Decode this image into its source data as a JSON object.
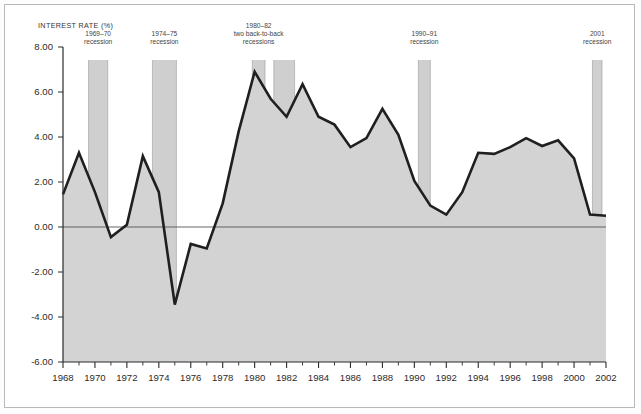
{
  "chart_data": {
    "type": "area",
    "title": "INTEREST RATE (%)",
    "xlabel": "",
    "ylabel": "INTEREST RATE (%)",
    "ylim": [
      -6.0,
      8.0
    ],
    "xlim": [
      1968,
      2002
    ],
    "grid": false,
    "legend": "none",
    "y_ticks": [
      "8.00",
      "6.00",
      "4.00",
      "2.00",
      "0.00",
      "-2.00",
      "-4.00",
      "-6.00"
    ],
    "y_tick_values": [
      8,
      6,
      4,
      2,
      0,
      -2,
      -4,
      -6
    ],
    "x_ticks": [
      "1968",
      "1970",
      "1972",
      "1974",
      "1976",
      "1978",
      "1980",
      "1982",
      "1984",
      "1986",
      "1988",
      "1990",
      "1992",
      "1994",
      "1996",
      "1998",
      "2000",
      "2002"
    ],
    "x_tick_values": [
      1968,
      1970,
      1972,
      1974,
      1976,
      1978,
      1980,
      1982,
      1984,
      1986,
      1988,
      1990,
      1992,
      1994,
      1996,
      1998,
      2000,
      2002
    ],
    "x_minor_step": 1,
    "series": [
      {
        "name": "Interest rate",
        "x": [
          1968,
          1969,
          1970,
          1971,
          1972,
          1973,
          1974,
          1975,
          1976,
          1977,
          1978,
          1979,
          1980,
          1981,
          1982,
          1983,
          1984,
          1985,
          1986,
          1987,
          1988,
          1989,
          1990,
          1991,
          1992,
          1993,
          1994,
          1995,
          1996,
          1997,
          1998,
          1999,
          2000,
          2001,
          2002
        ],
        "values": [
          1.45,
          3.3,
          1.55,
          -0.45,
          0.1,
          3.15,
          1.55,
          -3.45,
          -0.75,
          -0.95,
          1.05,
          4.25,
          6.9,
          5.7,
          4.9,
          6.35,
          4.9,
          4.55,
          3.55,
          3.95,
          5.25,
          4.1,
          2.05,
          0.95,
          0.55,
          1.55,
          3.3,
          3.25,
          3.55,
          3.95,
          3.6,
          3.85,
          3.05,
          0.55,
          0.5
        ]
      }
    ],
    "annotations": [
      {
        "id": "recession-1969-70",
        "label_line1": "1969–70",
        "label_line2": "recession",
        "x_start": 1969.6,
        "x_end": 1970.8
      },
      {
        "id": "recession-1974-75",
        "label_line1": "1974–75",
        "label_line2": "recession",
        "x_start": 1973.6,
        "x_end": 1975.1
      },
      {
        "id": "recession-1980-82a",
        "label_line1": "1980–82",
        "label_line2": "two back-to-back",
        "label_line3": "recessions",
        "x_start": 1979.85,
        "x_end": 1980.65
      },
      {
        "id": "recession-1980-82b",
        "label_line1": "",
        "label_line2": "",
        "x_start": 1981.2,
        "x_end": 1982.5
      },
      {
        "id": "recession-1990-91",
        "label_line1": "1990–91",
        "label_line2": "recession",
        "x_start": 1990.25,
        "x_end": 1991.0
      },
      {
        "id": "recession-2001",
        "label_line1": "2001",
        "label_line2": "recession",
        "x_start": 2001.15,
        "x_end": 2001.75
      }
    ],
    "colors": {
      "area_fill": "#d3d3d3",
      "line": "#1f1f1f",
      "recession_band": "#cfcfcf",
      "axis": "#2b2b2b",
      "zero_line": "#555555",
      "frame": "#b9b9b9",
      "background": "#ffffff"
    }
  },
  "labels": {
    "axis_title": "INTEREST RATE (%)",
    "y": [
      "8.00",
      "6.00",
      "4.00",
      "2.00",
      "0.00",
      "-2.00",
      "-4.00",
      "-6.00"
    ],
    "x": [
      "1968",
      "1970",
      "1972",
      "1974",
      "1976",
      "1978",
      "1980",
      "1982",
      "1984",
      "1986",
      "1988",
      "1990",
      "1992",
      "1994",
      "1996",
      "1998",
      "2000",
      "2002"
    ],
    "recessions": [
      {
        "l1": "1969–70",
        "l2": "recession"
      },
      {
        "l1": "1974–75",
        "l2": "recession"
      },
      {
        "l1": "1980–82",
        "l2": "two back-to-back",
        "l3": "recessions"
      },
      {
        "l1": "1990–91",
        "l2": "recession"
      },
      {
        "l1": "2001",
        "l2": "recession"
      }
    ]
  }
}
